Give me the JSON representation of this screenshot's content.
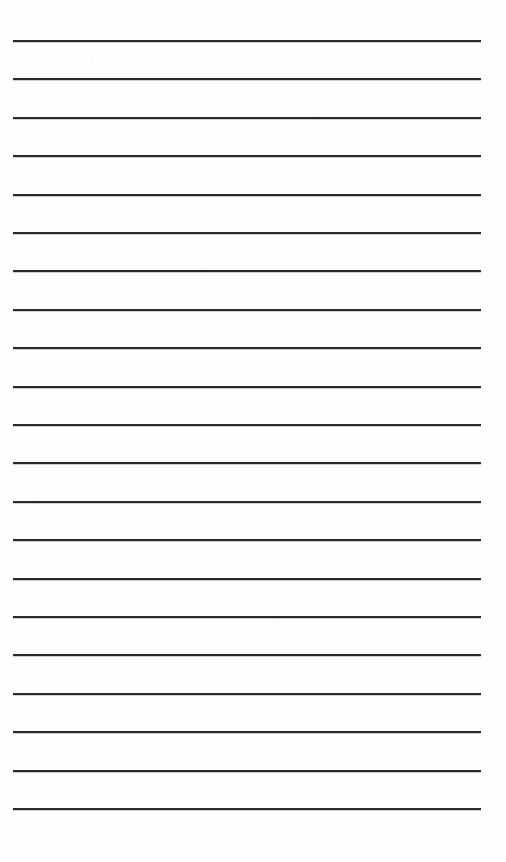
{
  "document": {
    "kind": "blank-ruled-notepaper-scan",
    "title": "Blank Lined Paper",
    "page_width": 506,
    "page_height": 862,
    "background_color": "#fefefe",
    "text_content": "",
    "has_text": false,
    "has_header": false,
    "has_margin_rule": false,
    "has_punch_holes": false
  },
  "ruling": {
    "line_count": 21,
    "line_color": "#2a2a2e",
    "line_thickness": 2,
    "line_left": 13,
    "line_right": 481,
    "line_width": 468,
    "first_line_y": 40,
    "last_line_y": 808,
    "line_spacing": 38.4,
    "top_margin": 40,
    "bottom_margin": 54,
    "left_margin": 13,
    "right_margin": 25,
    "lines": [
      {
        "index": 1,
        "y": 40.0,
        "x_start": 13,
        "x_end": 481,
        "thickness": 2.0
      },
      {
        "index": 2,
        "y": 78.4,
        "x_start": 13,
        "x_end": 481,
        "thickness": 2.0
      },
      {
        "index": 3,
        "y": 116.8,
        "x_start": 13,
        "x_end": 481,
        "thickness": 2.0
      },
      {
        "index": 4,
        "y": 155.2,
        "x_start": 13,
        "x_end": 481,
        "thickness": 2.0
      },
      {
        "index": 5,
        "y": 193.6,
        "x_start": 13,
        "x_end": 481,
        "thickness": 2.0
      },
      {
        "index": 6,
        "y": 232.0,
        "x_start": 13,
        "x_end": 481,
        "thickness": 2.0
      },
      {
        "index": 7,
        "y": 270.4,
        "x_start": 13,
        "x_end": 481,
        "thickness": 2.0
      },
      {
        "index": 8,
        "y": 308.8,
        "x_start": 13,
        "x_end": 481,
        "thickness": 2.0
      },
      {
        "index": 9,
        "y": 347.2,
        "x_start": 13,
        "x_end": 481,
        "thickness": 2.0
      },
      {
        "index": 10,
        "y": 385.6,
        "x_start": 13,
        "x_end": 481,
        "thickness": 2.0
      },
      {
        "index": 11,
        "y": 424.0,
        "x_start": 13,
        "x_end": 481,
        "thickness": 2.0
      },
      {
        "index": 12,
        "y": 462.4,
        "x_start": 13,
        "x_end": 481,
        "thickness": 2.0
      },
      {
        "index": 13,
        "y": 500.8,
        "x_start": 13,
        "x_end": 481,
        "thickness": 2.0
      },
      {
        "index": 14,
        "y": 539.2,
        "x_start": 13,
        "x_end": 481,
        "thickness": 2.0
      },
      {
        "index": 15,
        "y": 577.6,
        "x_start": 13,
        "x_end": 481,
        "thickness": 2.0
      },
      {
        "index": 16,
        "y": 616.0,
        "x_start": 13,
        "x_end": 481,
        "thickness": 2.0
      },
      {
        "index": 17,
        "y": 654.4,
        "x_start": 13,
        "x_end": 481,
        "thickness": 2.0
      },
      {
        "index": 18,
        "y": 692.8,
        "x_start": 13,
        "x_end": 481,
        "thickness": 2.0
      },
      {
        "index": 19,
        "y": 731.2,
        "x_start": 13,
        "x_end": 481,
        "thickness": 2.0
      },
      {
        "index": 20,
        "y": 769.6,
        "x_start": 13,
        "x_end": 481,
        "thickness": 2.0
      },
      {
        "index": 21,
        "y": 808.0,
        "x_start": 13,
        "x_end": 481,
        "thickness": 2.0
      }
    ]
  }
}
